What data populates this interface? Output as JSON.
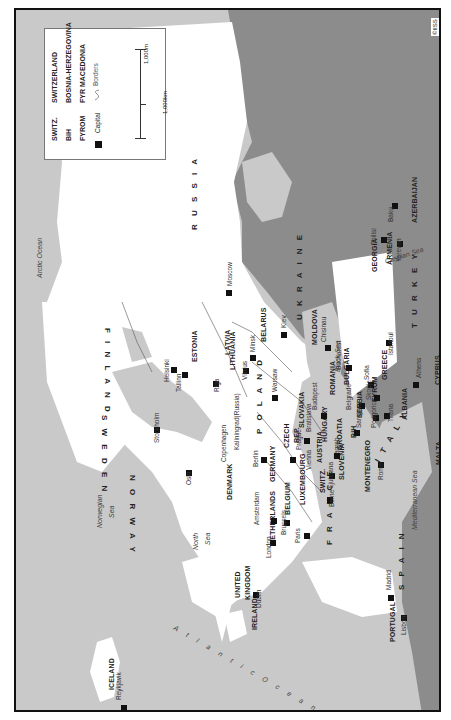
{
  "map": {
    "orientation": "rotated -90deg (north to the left)",
    "copyright": "©IISS",
    "colors": {
      "sea": "#c9c9c9",
      "land_focus": "#ffffff",
      "land_outside": "#8c8c8c",
      "border": "#111111"
    },
    "legend": {
      "abbreviations": [
        {
          "abbr": "SWITZ.",
          "full": "SWITZERLAND"
        },
        {
          "abbr": "BiH",
          "full": "BOSNIA-HERZEGOVINA"
        },
        {
          "abbr": "FYROM",
          "full": "FYR MACEDONIA"
        }
      ],
      "capital_label": "Capital",
      "borders_label": "Borders",
      "scale_miles": "1,000m",
      "scale_km": "1,000km"
    },
    "countries": [
      "RUSSIA",
      "FINLAND",
      "SWEDEN",
      "NORWAY",
      "ICELAND",
      "ESTONIA",
      "LATVIA",
      "LITHUANIA",
      "BELARUS",
      "UKRAINE",
      "MOLDOVA",
      "POLAND",
      "GERMANY",
      "DENMARK",
      "NETHERLANDS",
      "BELGIUM",
      "LUXEMBOURG",
      "FRANCE",
      "UNITED KINGDOM",
      "IRELAND",
      "SPAIN",
      "PORTUGAL",
      "CZECH REP.",
      "SLOVAKIA",
      "AUSTRIA",
      "SWITZ.",
      "HUNGARY",
      "SLOVENIA",
      "CROATIA",
      "BiH",
      "SERBIA",
      "MONTENEGRO",
      "ROMANIA",
      "BULGARIA",
      "FYROM",
      "ALBANIA",
      "GREECE",
      "ITALY",
      "MALTA",
      "CYPRUS",
      "TURKEY",
      "GEORGIA",
      "ARMENIA",
      "AZERBAIJAN"
    ],
    "capitals": [
      "Moscow",
      "Helsinki",
      "Tallinn",
      "Riga",
      "Vilnius",
      "Minsk",
      "Kiev",
      "Chisinau",
      "Stockholm",
      "Oslo",
      "Copenhagen",
      "Kaliningrad (Russia)",
      "Warsaw",
      "Berlin",
      "Prague",
      "Vienna",
      "Bratislava",
      "Budapest",
      "Bucharest",
      "Belgrade",
      "Sofia",
      "Zagreb",
      "Ljubljana",
      "Sarajevo",
      "Podgorica",
      "Skopje",
      "Tirana",
      "Athens",
      "Rome",
      "Berne",
      "Paris",
      "Brussels",
      "Amsterdam",
      "London",
      "Dublin",
      "Reykjavik",
      "Madrid",
      "Lisbon",
      "Istanbul",
      "Tbilisi",
      "Yerevan",
      "Baku"
    ],
    "water_bodies": [
      "Arctic Ocean",
      "Norwegian Sea",
      "North Sea",
      "Atlantic Ocean",
      "Mediterranean Sea",
      "Black Sea",
      "Caspian Sea"
    ],
    "labels": {
      "russia": "R U S S I A",
      "finland": "F I N L A N D",
      "sweden": "S W E D E N",
      "norway": "N O R W A Y",
      "iceland": "ICELAND",
      "estonia": "ESTONIA",
      "latvia": "LATVIA",
      "lithuania": "LITHUANIA",
      "belarus": "BELARUS",
      "ukraine": "U K R A I N E",
      "moldova": "MOLDOVA",
      "poland": "P O L A N D",
      "germany": "GERMANY",
      "denmark": "DENMARK",
      "netherlands": "NETHERLANDS",
      "belgium": "BELGIUM",
      "luxembourg": "LUXEMBOURG",
      "france": "F R A N C E",
      "uk1": "UNITED",
      "uk2": "KINGDOM",
      "ireland": "IRELAND",
      "spain": "S P A I N",
      "portugal": "PORTUGAL",
      "czech1": "CZECH",
      "czech2": "REP.",
      "slovakia": "SLOVAKIA",
      "austria": "AUSTRIA",
      "switz": "SWITZ.",
      "hungary": "HUNGARY",
      "slovenia": "SLOVENIA",
      "croatia": "CROATIA",
      "bih": "BiH",
      "serbia": "SERBIA",
      "montenegro": "MONTENEGRO",
      "romania": "ROMANIA",
      "bulgaria": "BULGARIA",
      "fyrom": "FYROM",
      "albania": "ALBANIA",
      "greece": "GREECE",
      "italy": "I T A L Y",
      "malta": "MALTA",
      "cyprus": "CYPRUS",
      "turkey": "T U R K E Y",
      "georgia": "GEORGIA",
      "armenia": "ARMENIA",
      "azerbaijan": "AZERBAIJAN",
      "moscow": "Moscow",
      "helsinki": "Helsinki",
      "tallinn": "Tallinn",
      "riga": "Riga",
      "vilnius": "Vilnius",
      "minsk": "Minsk",
      "kiev": "Kiev",
      "chisinau": "Chisinau",
      "stockholm": "Stockholm",
      "oslo": "Oslo",
      "copenhagen": "Copenhagen",
      "kaliningrad": "Kaliningrad(Russia)",
      "warsaw": "Warsaw",
      "berlin": "Berlin",
      "prague": "Prague",
      "vienna": "Vienna",
      "bratislava": "Bratislava",
      "budapest": "Budapest",
      "bucharest": "Bucharest",
      "belgrade": "Belgrade",
      "sofia": "Sofia",
      "zagreb": "Zagreb",
      "ljubljana": "Ljubljana",
      "sarajevo": "Sarajevo",
      "podgorica": "Podgorica",
      "skopje": "Skopje",
      "tirana": "Tirana",
      "athens": "Athens",
      "rome": "Rome",
      "berne": "Berne",
      "paris": "Paris",
      "brussels": "Brussels",
      "amsterdam": "Amsterdam",
      "london": "London",
      "dublin": "Dublin",
      "reykjavik": "Reykjavik",
      "madrid": "Madrid",
      "lisbon": "Lisbon",
      "istanbul": "Istanbul",
      "tbilisi": "Tbilisi",
      "yerevan": "Yerevan",
      "baku": "Baku",
      "arctic": "Arctic Ocean",
      "norwegian1": "Norwegian",
      "norwegian2": "Sea",
      "north1": "North",
      "north2": "Sea",
      "atlantic": "A t l a n t i c   O c e a n",
      "mediterranean": "Mediterranean Sea",
      "black": "Black Sea",
      "caspian": "Caspian Sea"
    }
  }
}
